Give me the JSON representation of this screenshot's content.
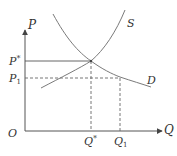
{
  "diagram": {
    "type": "supply-demand",
    "colors": {
      "curve": "#7a7a7a",
      "axis": "#555555",
      "text": "#333333"
    },
    "axes": {
      "y_label": "P",
      "x_label": "Q",
      "origin_label": "O"
    },
    "curves": [
      {
        "name": "S",
        "label": "S"
      },
      {
        "name": "D",
        "label": "D"
      }
    ],
    "price_levels": [
      {
        "label": "P",
        "sup": "*",
        "style": "solid"
      },
      {
        "label": "P",
        "sub": "1",
        "style": "dashed"
      }
    ],
    "quantity_levels": [
      {
        "label": "Q",
        "sup": "*",
        "style": "dashed"
      },
      {
        "label": "Q",
        "sub": "1",
        "style": "dashed"
      }
    ]
  }
}
